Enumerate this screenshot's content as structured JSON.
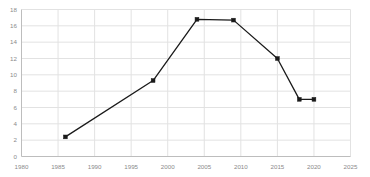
{
  "chart_data": {
    "type": "line",
    "title": "",
    "subtitle": "",
    "xlabel": "",
    "ylabel": "",
    "xlim": [
      1980,
      2025
    ],
    "ylim": [
      0,
      18
    ],
    "grid": true,
    "legend": false,
    "legend_position": "none",
    "xticks": [
      1980,
      1985,
      1990,
      1995,
      2000,
      2005,
      2010,
      2015,
      2020,
      2025
    ],
    "xtick_labels": [
      "1980",
      "1985",
      "1990",
      "1995",
      "2000",
      "2005",
      "2010",
      "2015",
      "2020",
      "2025"
    ],
    "yticks": [
      0,
      2,
      4,
      6,
      8,
      10,
      12,
      14,
      16,
      18
    ],
    "ytick_labels": [
      "0",
      "2",
      "4",
      "6",
      "8",
      "10",
      "12",
      "14",
      "16",
      "18"
    ],
    "series": [
      {
        "name": "series-1",
        "color": "#1a1a1a",
        "marker": "square",
        "x": [
          1986,
          1998,
          2004,
          2009,
          2015,
          2018,
          2020
        ],
        "values": [
          2.4,
          9.3,
          16.8,
          16.7,
          12.0,
          7.0,
          7.0
        ]
      }
    ],
    "annotations": []
  },
  "style": {
    "background": "#ffffff",
    "grid_color": "#e2e2e2",
    "axis_color": "#bdbdbd",
    "tick_label_color": "#8a8a8a",
    "line_color": "#1a1a1a"
  }
}
